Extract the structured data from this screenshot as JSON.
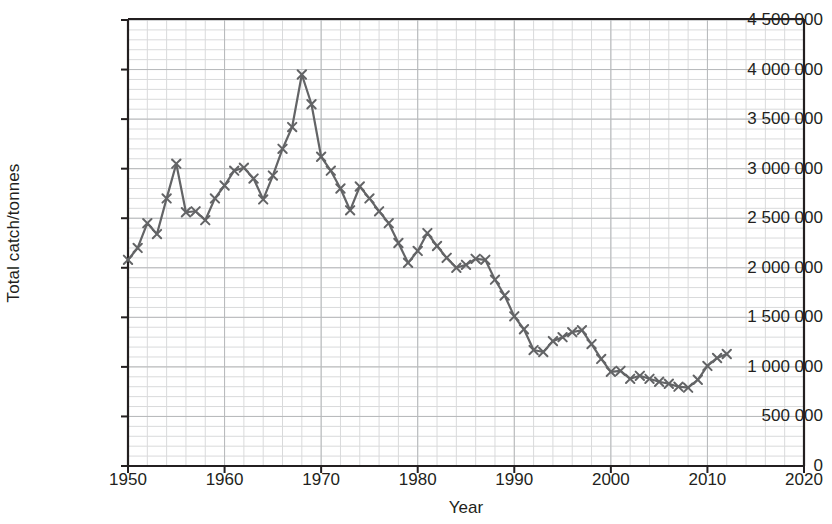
{
  "chart_data": {
    "type": "line",
    "title": "",
    "xlabel": "Year",
    "ylabel": "Total catch/tonnes",
    "xlim": [
      1950,
      2020
    ],
    "ylim": [
      0,
      4500000
    ],
    "xticks": [
      1950,
      1960,
      1970,
      1980,
      1990,
      2000,
      2010,
      2020
    ],
    "xtick_labels": [
      "1950",
      "1960",
      "1970",
      "1980",
      "1990",
      "2000",
      "2010",
      "2020"
    ],
    "yticks": [
      0,
      500000,
      1000000,
      1500000,
      2000000,
      2500000,
      3000000,
      3500000,
      4000000,
      4500000
    ],
    "ytick_labels": [
      "0",
      "500 000",
      "1 000 000",
      "1 500 000",
      "2 000 000",
      "2 500 000",
      "3 000 000",
      "3 500 000",
      "4 000 000",
      "4 500 000"
    ],
    "grid": true,
    "grid_minor_x_step": 2,
    "grid_minor_y_step": 100000,
    "grid_major_x_step": 10,
    "grid_major_y_step": 500000,
    "legend": null,
    "marker": "x",
    "line_color": "#636466",
    "marker_color": "#636466",
    "grid_color": "#d9dadb",
    "grid_major_color": "#b7b9bb",
    "axis_color": "#231f20",
    "x": [
      1950,
      1951,
      1952,
      1953,
      1954,
      1955,
      1956,
      1957,
      1958,
      1959,
      1960,
      1961,
      1962,
      1963,
      1964,
      1965,
      1966,
      1967,
      1968,
      1969,
      1970,
      1971,
      1972,
      1973,
      1974,
      1975,
      1976,
      1977,
      1978,
      1979,
      1980,
      1981,
      1982,
      1983,
      1984,
      1985,
      1986,
      1987,
      1988,
      1989,
      1990,
      1991,
      1992,
      1993,
      1994,
      1995,
      1996,
      1997,
      1998,
      1999,
      2000,
      2001,
      2002,
      2003,
      2004,
      2005,
      2006,
      2007,
      2008,
      2009,
      2010,
      2011,
      2012
    ],
    "values": [
      2080000,
      2200000,
      2450000,
      2340000,
      2700000,
      3050000,
      2560000,
      2570000,
      2480000,
      2700000,
      2830000,
      2980000,
      3010000,
      2900000,
      2690000,
      2930000,
      3200000,
      3420000,
      3950000,
      3650000,
      3120000,
      2980000,
      2800000,
      2580000,
      2820000,
      2700000,
      2570000,
      2450000,
      2250000,
      2050000,
      2170000,
      2350000,
      2220000,
      2100000,
      2000000,
      2030000,
      2090000,
      2080000,
      1880000,
      1720000,
      1510000,
      1380000,
      1170000,
      1150000,
      1260000,
      1300000,
      1350000,
      1370000,
      1230000,
      1080000,
      950000,
      960000,
      880000,
      910000,
      880000,
      850000,
      830000,
      800000,
      790000,
      870000,
      1010000,
      1090000,
      1130000
    ]
  }
}
